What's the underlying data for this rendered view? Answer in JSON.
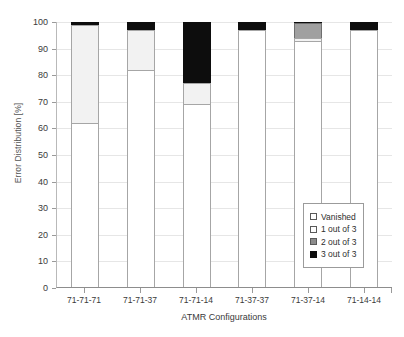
{
  "chart_data": {
    "type": "bar",
    "subtype": "stacked",
    "title": "",
    "xlabel": "ATMR Configurations",
    "ylabel": "Error Distribution [%]",
    "categories": [
      "71-71-71",
      "71-71-37",
      "71-71-14",
      "71-37-37",
      "71-37-14",
      "71-14-14"
    ],
    "ylim": [
      0,
      100
    ],
    "yticks": [
      0,
      10,
      20,
      30,
      40,
      50,
      60,
      70,
      80,
      90,
      100
    ],
    "grid": true,
    "legend_position": "inside-bottom-right",
    "series": [
      {
        "name": "Vanished",
        "color": "#ffffff",
        "values": [
          62,
          82,
          69,
          97,
          93,
          97
        ]
      },
      {
        "name": "1 out of 3",
        "color": "#f2f2f2",
        "values": [
          37,
          15,
          8,
          0,
          1,
          0
        ]
      },
      {
        "name": "2 out of 3",
        "color": "#a0a0a0",
        "values": [
          0,
          0,
          0,
          0,
          5.5,
          0
        ]
      },
      {
        "name": "3 out of 3",
        "color": "#0d0d0d",
        "values": [
          1,
          3,
          23,
          3,
          0.5,
          3
        ]
      }
    ]
  },
  "axis": {
    "y_tick_labels": [
      "0",
      "10",
      "20",
      "30",
      "40",
      "50",
      "60",
      "70",
      "80",
      "90",
      "100"
    ],
    "y_title": "Error Distribution [%]",
    "x_title": "ATMR Configurations",
    "x_tick_labels": [
      "71-71-71",
      "71-71-37",
      "71-71-14",
      "71-37-37",
      "71-37-14",
      "71-14-14"
    ]
  },
  "legend": {
    "items": [
      {
        "label": "Vanished"
      },
      {
        "label": "1 out of 3"
      },
      {
        "label": "2 out of 3"
      },
      {
        "label": "3 out of 3"
      }
    ]
  }
}
